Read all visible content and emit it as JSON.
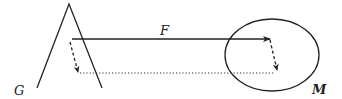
{
  "diagram": {
    "labels": {
      "force": "F",
      "left_body": "G",
      "right_body": "M"
    },
    "colors": {
      "stroke": "#222222",
      "background": "#ffffff"
    },
    "elements": [
      {
        "id": "triangle-G",
        "shape": "inverted-V",
        "apex": [
          69,
          4
        ],
        "left_foot": [
          37,
          88
        ],
        "right_foot": [
          102,
          88
        ]
      },
      {
        "id": "ellipse-M",
        "shape": "ellipse",
        "center": [
          272,
          55
        ],
        "rx": 47,
        "ry": 36
      },
      {
        "id": "arrow-F",
        "style": "solid",
        "from": [
          72,
          39
        ],
        "to": [
          270,
          39
        ]
      },
      {
        "id": "dashed-arrow-left",
        "style": "dashed",
        "from": [
          70,
          42
        ],
        "to": [
          78,
          72
        ]
      },
      {
        "id": "dashed-arrow-right",
        "style": "dashed",
        "from": [
          270,
          40
        ],
        "to": [
          277,
          70
        ]
      },
      {
        "id": "dotted-line",
        "style": "dotted",
        "from": [
          80,
          73
        ],
        "to": [
          275,
          73
        ]
      }
    ]
  }
}
